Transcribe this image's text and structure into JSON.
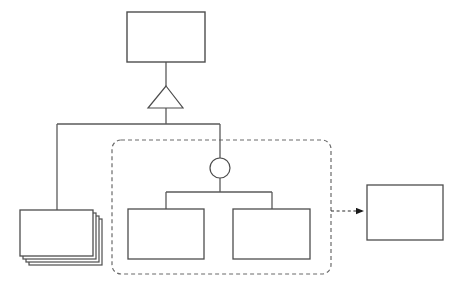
{
  "diagram": {
    "type": "uml-structure-diagram",
    "canvas": {
      "width": 459,
      "height": 288,
      "background": "#ffffff"
    },
    "style": {
      "stroke_color": "#5a5a5a",
      "stroke_color_dark": "#4d4d4d",
      "fill_color": "#ffffff",
      "stroke_width": 1.2,
      "dashed_pattern": "4,3",
      "arrow_fill": "#1a1a1a"
    },
    "nodes": [
      {
        "id": "top-class",
        "name": "top-class-box",
        "shape": "rectangle",
        "label": "",
        "x": 127,
        "y": 12,
        "width": 78,
        "height": 50
      },
      {
        "id": "stacked-class",
        "name": "stacked-class-box",
        "shape": "stacked-rectangle",
        "label": "",
        "x": 20,
        "y": 210,
        "width": 73,
        "height": 46,
        "stack_count": 3,
        "stack_offset": 3
      },
      {
        "id": "inner-left-class",
        "name": "inner-left-class-box",
        "shape": "rectangle",
        "label": "",
        "x": 128,
        "y": 209,
        "width": 76,
        "height": 50
      },
      {
        "id": "inner-right-class",
        "name": "inner-right-class-box",
        "shape": "rectangle",
        "label": "",
        "x": 233,
        "y": 209,
        "width": 77,
        "height": 50
      },
      {
        "id": "target-class",
        "name": "target-class-box",
        "shape": "rectangle",
        "label": "",
        "x": 367,
        "y": 185,
        "width": 76,
        "height": 55
      },
      {
        "id": "grouping-container",
        "name": "dashed-grouping-container",
        "shape": "rounded-dashed-rectangle",
        "label": "",
        "x": 112,
        "y": 140,
        "width": 219,
        "height": 134,
        "corner_radius": 9
      },
      {
        "id": "junction-circle",
        "name": "junction-circle",
        "shape": "circle",
        "label": "",
        "cx": 220,
        "cy": 168,
        "r": 10
      },
      {
        "id": "generalization-triangle",
        "name": "generalization-triangle",
        "shape": "triangle",
        "label": "",
        "apex_x": 166,
        "apex_y": 86,
        "base_left_x": 148,
        "base_right_x": 183,
        "base_y": 108
      }
    ],
    "edges": [
      {
        "id": "edge-top-to-triangle",
        "name": "generalization-stem-upper",
        "style": "solid",
        "path": "M166,62 L166,86"
      },
      {
        "id": "edge-triangle-to-bus",
        "name": "generalization-stem-lower",
        "style": "solid",
        "path": "M166,108 L166,124"
      },
      {
        "id": "edge-horizontal-bus",
        "name": "generalization-horizontal-bus",
        "style": "solid",
        "path": "M57,124 L220,124"
      },
      {
        "id": "edge-bus-to-stacked",
        "name": "branch-to-stacked-class",
        "style": "solid",
        "path": "M57,124 L57,210"
      },
      {
        "id": "edge-bus-to-circle",
        "name": "branch-to-junction-circle",
        "style": "solid",
        "path": "M220,124 L220,158"
      },
      {
        "id": "edge-circle-to-fork",
        "name": "junction-stem",
        "style": "solid",
        "path": "M220,178 L220,192"
      },
      {
        "id": "edge-inner-fork",
        "name": "inner-fork-horizontal",
        "style": "solid",
        "path": "M166,192 L272,192"
      },
      {
        "id": "edge-fork-to-left-box",
        "name": "fork-drop-left",
        "style": "solid",
        "path": "M166,192 L166,209"
      },
      {
        "id": "edge-fork-to-right-box",
        "name": "fork-drop-right",
        "style": "solid",
        "path": "M272,192 L272,209"
      },
      {
        "id": "edge-dependency",
        "name": "dependency-dashed-arrow",
        "style": "dashed",
        "arrowhead": "filled-triangle",
        "path": "M331,211 L365,211"
      }
    ]
  }
}
